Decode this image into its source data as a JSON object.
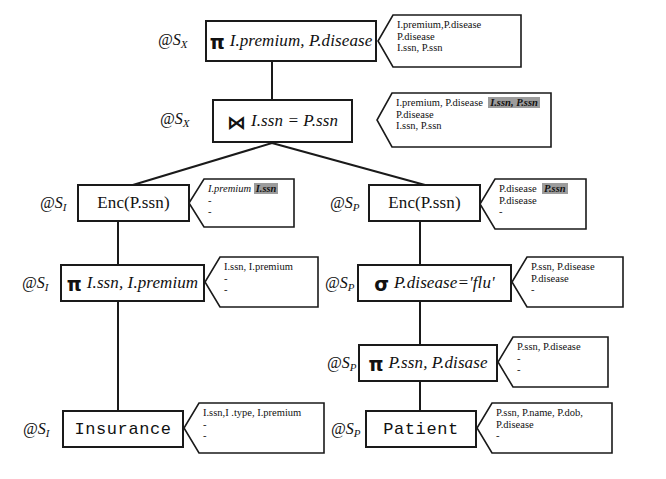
{
  "diagram": {
    "nodes": [
      {
        "id": "project-top",
        "tag": "@S",
        "tag_sub": "X",
        "operator": "π",
        "expr_plain": "I.premium, P.disease",
        "kind": "operator",
        "annotation": {
          "line1": "I.premium,P.disease",
          "line1_highlight": "",
          "line2": "P.disease",
          "line3": "I.ssn, P.ssn"
        }
      },
      {
        "id": "join",
        "tag": "@S",
        "tag_sub": "X",
        "operator": "⋈",
        "expr_plain": "I.ssn = P.ssn",
        "kind": "operator",
        "annotation": {
          "line1": "I.premium, P.disease",
          "line1_highlight": "I.ssn, P.ssn",
          "line2": "P.disease",
          "line3": "I.ssn, P.ssn"
        }
      },
      {
        "id": "enc-left",
        "tag": "@S",
        "tag_sub": "I",
        "operator": "",
        "expr_plain": "Enc(P.ssn)",
        "kind": "operator",
        "annotation": {
          "line1": "I.premium",
          "line1_highlight": "I.ssn",
          "line2": "-",
          "line3": "-"
        }
      },
      {
        "id": "enc-right",
        "tag": "@S",
        "tag_sub": "P",
        "operator": "",
        "expr_plain": "Enc(P.ssn)",
        "kind": "operator",
        "annotation": {
          "line1": "P.disease",
          "line1_highlight": "P.ssn",
          "line2": "P.disease",
          "line3": "-"
        }
      },
      {
        "id": "project-left",
        "tag": "@S",
        "tag_sub": "I",
        "operator": "π",
        "expr_plain": "I.ssn, I.premium",
        "kind": "operator",
        "annotation": {
          "line1": "I.ssn, I.premium",
          "line1_highlight": "",
          "line2": "-",
          "line3": "-"
        }
      },
      {
        "id": "select-right",
        "tag": "@S",
        "tag_sub": "P",
        "operator": "σ",
        "expr_plain": "P.disease='flu'",
        "kind": "operator",
        "annotation": {
          "line1": "P.ssn, P.disease",
          "line1_highlight": "",
          "line2": "P.disease",
          "line3": "-"
        }
      },
      {
        "id": "project-right",
        "tag": "@S",
        "tag_sub": "P",
        "operator": "π",
        "expr_plain": "P.ssn, P.disase",
        "kind": "operator",
        "annotation": {
          "line1": "P.ssn, P.disease",
          "line1_highlight": "",
          "line2": "-",
          "line3": "-"
        }
      },
      {
        "id": "insurance",
        "tag": "@S",
        "tag_sub": "I",
        "operator": "",
        "expr_plain": "Insurance",
        "kind": "relation",
        "annotation": {
          "line1": "I.ssn,I .type, I.premium",
          "line1_highlight": "",
          "line2": "-",
          "line3": "-"
        }
      },
      {
        "id": "patient",
        "tag": "@S",
        "tag_sub": "P",
        "operator": "",
        "expr_plain": "Patient",
        "kind": "relation",
        "annotation": {
          "line1": "P.ssn, P.name, P.dob,",
          "line1_highlight": "",
          "line2": "P.disease",
          "line3": "-"
        }
      }
    ],
    "colors": {
      "stroke": "#1a1a1a",
      "background": "#ffffff",
      "highlight": "#9c9c9c"
    }
  }
}
